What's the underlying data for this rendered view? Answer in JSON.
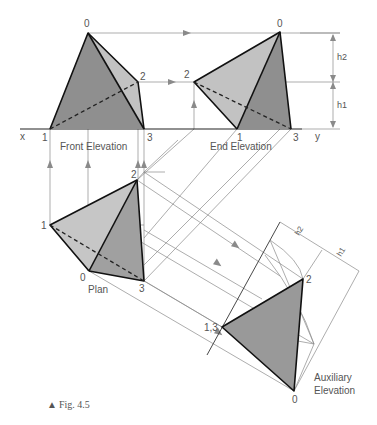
{
  "figure": {
    "caption_marker": "▲",
    "caption": "Fig. 4.5",
    "colors": {
      "face_dark": "#8f8f8f",
      "face_mid": "#a8a8a8",
      "face_light": "#c6c6c6",
      "construction": "#8a8a8a",
      "outline": "#111111"
    }
  },
  "views": {
    "front_elevation": {
      "label": "Front Elevation",
      "vertices": {
        "v0": "0",
        "v1": "1",
        "v2": "2",
        "v3": "3"
      }
    },
    "end_elevation": {
      "label": "End Elevation",
      "vertices": {
        "v0": "0",
        "v1": "1",
        "v2": "2",
        "v3": "3"
      }
    },
    "plan": {
      "label": "Plan",
      "vertices": {
        "v0": "0",
        "v1": "1",
        "v2": "2",
        "v3": "3"
      }
    },
    "auxiliary_elevation": {
      "label_line1": "Auxiliary",
      "label_line2": "Elevation",
      "vertices": {
        "v0": "0",
        "v13": "1,3",
        "v2": "2"
      }
    }
  },
  "axis": {
    "x": "x",
    "y": "y"
  },
  "dimensions": {
    "end_h2": "h2",
    "end_h1": "h1",
    "aux_h2": "h2",
    "aux_h1": "h1"
  }
}
